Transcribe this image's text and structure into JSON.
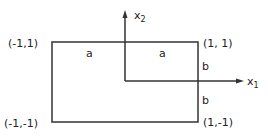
{
  "diagram": {
    "corners": {
      "top_left": "(-1,1)",
      "top_right": "(1, 1)",
      "bottom_left": "(-1,-1)",
      "bottom_right": "(1,-1)"
    },
    "axes": {
      "x1": {
        "base": "x",
        "sub": "1"
      },
      "x2": {
        "base": "x",
        "sub": "2"
      }
    },
    "side_labels": {
      "top_left_a": "a",
      "top_right_a": "a",
      "right_upper_b": "b",
      "right_lower_b": "b"
    },
    "colors": {
      "line": "#333333",
      "text": "#222222",
      "background": "#ffffff"
    }
  }
}
